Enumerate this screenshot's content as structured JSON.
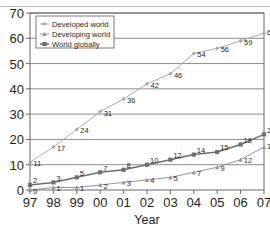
{
  "chart_data": {
    "type": "line",
    "title": "",
    "xlabel": "Year",
    "ylabel": "",
    "categories": [
      "97",
      "98",
      "99",
      "00",
      "01",
      "02",
      "03",
      "04",
      "05",
      "06",
      "07"
    ],
    "xlim": [
      0,
      10
    ],
    "ylim": [
      0,
      70
    ],
    "yticks": [
      0,
      10,
      20,
      30,
      40,
      50,
      60,
      70
    ],
    "grid": true,
    "legend_position": "top-left",
    "series": [
      {
        "name": "Developed world",
        "color": "#a7a9ac",
        "marker": "diamond",
        "values": [
          11,
          17,
          24,
          31,
          36,
          42,
          46,
          54,
          56,
          59,
          62
        ],
        "labels": [
          "11",
          "17",
          "24",
          "31",
          "36",
          "42",
          "46",
          "54",
          "56",
          "59",
          "62"
        ]
      },
      {
        "name": "Developing world",
        "color": "#939598",
        "marker": "triangle",
        "values": [
          0,
          1,
          1,
          2,
          3,
          4,
          5,
          7,
          9,
          12,
          17
        ],
        "labels": [
          "0",
          "1",
          "1",
          "2",
          "3",
          "4",
          "5",
          "7",
          "9",
          "12",
          "17"
        ]
      },
      {
        "name": "World globally",
        "color": "#6d6e71",
        "marker": "square",
        "values": [
          2,
          3,
          5,
          7,
          8,
          10,
          12,
          14,
          15,
          18,
          22
        ],
        "labels": [
          "2",
          "3",
          "5",
          "7",
          "8",
          "10",
          "12",
          "14",
          "15",
          "18",
          "22"
        ]
      }
    ]
  },
  "legend": {
    "items": [
      {
        "label": "Developed world"
      },
      {
        "label": "Developing world"
      },
      {
        "label": "World globally"
      }
    ]
  },
  "axis": {
    "x_title": "Year"
  }
}
